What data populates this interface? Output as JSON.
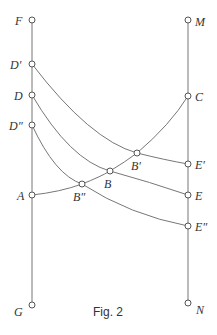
{
  "figure": {
    "caption": "Fig. 2",
    "points": {
      "F": "F",
      "D_prime": "D′",
      "D": "D",
      "D_dprime": "D″",
      "A": "A",
      "G": "G",
      "M": "M",
      "C": "C",
      "E_prime": "E′",
      "E": "E",
      "E_dprime": "E″",
      "N": "N",
      "B_prime": "B′",
      "B": "B",
      "B_dprime": "B″"
    }
  }
}
